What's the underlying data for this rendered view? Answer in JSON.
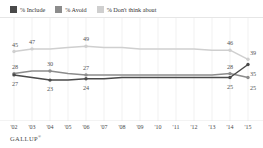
{
  "legend": {
    "items": [
      {
        "label": "% Include",
        "color": "#4a4a4a",
        "icon": "legend-swatch-include"
      },
      {
        "label": "% Avoid",
        "color": "#8c8c8c",
        "icon": "legend-swatch-avoid"
      },
      {
        "label": "% Don't think about",
        "color": "#cfcfcf",
        "icon": "legend-swatch-dont-think-about"
      }
    ]
  },
  "source": {
    "name": "GALLUP",
    "mark": "®"
  },
  "chart_data": {
    "type": "line",
    "title": "",
    "subtitle": "",
    "xlabel": "",
    "ylabel": "",
    "grid": "vertical",
    "legend_position": "top-left",
    "ylim": [
      0,
      60
    ],
    "categories": [
      "'02",
      "'03",
      "'04",
      "'05",
      "'06",
      "'07",
      "'08",
      "'09",
      "'10",
      "'11",
      "'12",
      "'13",
      "'14",
      "'15"
    ],
    "series": [
      {
        "name": "% Don't think about",
        "color": "#cfcfcf",
        "values": [
          45,
          47,
          47,
          48,
          49,
          48,
          48,
          47,
          47,
          47,
          47,
          46,
          46,
          39
        ],
        "labels": [
          {
            "x": "'02",
            "value": 45
          },
          {
            "x": "'03",
            "value": 47
          },
          {
            "x": "'06",
            "value": 49
          },
          {
            "x": "'14",
            "value": 46
          },
          {
            "x": "'15",
            "value": 39
          }
        ]
      },
      {
        "name": "% Avoid",
        "color": "#8c8c8c",
        "values": [
          28,
          30,
          30,
          28,
          27,
          27,
          27,
          27,
          27,
          27,
          27,
          27,
          28,
          25
        ],
        "labels": [
          {
            "x": "'02",
            "value": 28
          },
          {
            "x": "'04",
            "value": 30
          },
          {
            "x": "'06",
            "value": 27
          },
          {
            "x": "'14",
            "value": 28
          },
          {
            "x": "'15",
            "value": 25
          }
        ]
      },
      {
        "name": "% Include",
        "color": "#4a4a4a",
        "values": [
          27,
          25,
          23,
          23,
          24,
          24,
          25,
          25,
          25,
          25,
          25,
          25,
          25,
          35
        ],
        "labels": [
          {
            "x": "'02",
            "value": 27
          },
          {
            "x": "'04",
            "value": 23
          },
          {
            "x": "'06",
            "value": 24
          },
          {
            "x": "'14",
            "value": 25
          },
          {
            "x": "'15",
            "value": 35
          }
        ]
      }
    ]
  }
}
